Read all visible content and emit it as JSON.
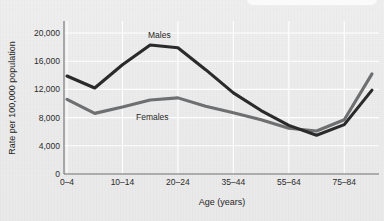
{
  "chart_data": {
    "type": "line",
    "title": "",
    "xlabel": "Age (years)",
    "ylabel": "Rate per 100,000 population",
    "grid": "white gridlines, horizontal and vertical",
    "legend": "inline series labels on plot",
    "ylim": [
      0,
      22000
    ],
    "yticks": [
      0,
      4000,
      8000,
      12000,
      16000,
      20000
    ],
    "ytick_labels": [
      "0",
      "4,000",
      "8,000",
      "12,000",
      "16,000",
      "20,000"
    ],
    "categories": [
      "0–4",
      "5–9",
      "10–14",
      "15–19",
      "20–24",
      "25–34",
      "35–44",
      "45–54",
      "55–64",
      "65–74",
      "75–84",
      "85+"
    ],
    "xtick_labels": [
      "0–4",
      "10–14",
      "20–24",
      "35–44",
      "55–64",
      "75–84"
    ],
    "xtick_indices": [
      0,
      2,
      4,
      6,
      8,
      10
    ],
    "series": [
      {
        "name": "Males",
        "color": "#2a2a2a",
        "values": [
          13900,
          12200,
          15500,
          18300,
          17900,
          14800,
          11500,
          9000,
          6900,
          5500,
          7000,
          11900
        ]
      },
      {
        "name": "Females",
        "color": "#6e6f71",
        "values": [
          10600,
          8600,
          9500,
          10500,
          10800,
          9600,
          8700,
          7700,
          6500,
          6100,
          7700,
          14200
        ]
      }
    ],
    "annotations": [
      {
        "text": "Males",
        "series": "Males"
      },
      {
        "text": "Females",
        "series": "Females"
      }
    ]
  },
  "colors": {
    "background": "#ededed",
    "gridline": "#ffffff",
    "axis": "#6f7072",
    "males": "#2a2a2a",
    "females": "#6e6f71",
    "text": "#1f1f1f"
  }
}
